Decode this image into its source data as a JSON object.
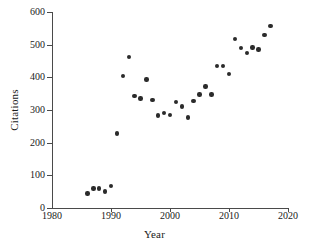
{
  "chart_data": {
    "type": "scatter",
    "title": "",
    "xlabel": "Year",
    "ylabel": "Citations",
    "xlim": [
      1980,
      2020
    ],
    "ylim": [
      0,
      600
    ],
    "xticks": [
      1980,
      1990,
      2000,
      2010,
      2020
    ],
    "yticks": [
      0,
      100,
      200,
      300,
      400,
      500,
      600
    ],
    "grid": false,
    "legend": null,
    "series": [
      {
        "name": "Citations",
        "marker": "filled-circle",
        "color": "#2b2b2b",
        "points": [
          {
            "x": 1986,
            "y": 45
          },
          {
            "x": 1987,
            "y": 60
          },
          {
            "x": 1988,
            "y": 60
          },
          {
            "x": 1989,
            "y": 50
          },
          {
            "x": 1990,
            "y": 68
          },
          {
            "x": 1991,
            "y": 228
          },
          {
            "x": 1992,
            "y": 405
          },
          {
            "x": 1993,
            "y": 462
          },
          {
            "x": 1994,
            "y": 342
          },
          {
            "x": 1995,
            "y": 335
          },
          {
            "x": 1996,
            "y": 393
          },
          {
            "x": 1997,
            "y": 330
          },
          {
            "x": 1998,
            "y": 283
          },
          {
            "x": 1999,
            "y": 290
          },
          {
            "x": 2000,
            "y": 284
          },
          {
            "x": 2001,
            "y": 324
          },
          {
            "x": 2002,
            "y": 311
          },
          {
            "x": 2003,
            "y": 277
          },
          {
            "x": 2004,
            "y": 327
          },
          {
            "x": 2005,
            "y": 347
          },
          {
            "x": 2006,
            "y": 372
          },
          {
            "x": 2007,
            "y": 348
          },
          {
            "x": 2008,
            "y": 435
          },
          {
            "x": 2009,
            "y": 435
          },
          {
            "x": 2010,
            "y": 410
          },
          {
            "x": 2011,
            "y": 518
          },
          {
            "x": 2012,
            "y": 489
          },
          {
            "x": 2013,
            "y": 475
          },
          {
            "x": 2014,
            "y": 491
          },
          {
            "x": 2015,
            "y": 485
          },
          {
            "x": 2016,
            "y": 530
          },
          {
            "x": 2017,
            "y": 557
          }
        ]
      }
    ]
  },
  "axes": {
    "y_label": "Citations",
    "x_label": "Year",
    "y_tick_labels": [
      "0",
      "100",
      "200",
      "300",
      "400",
      "500",
      "600"
    ],
    "x_tick_labels": [
      "1980",
      "1990",
      "2000",
      "2010",
      "2020"
    ]
  },
  "colors": {
    "marker": "#2b2b2b",
    "axis": "#4a4a4a",
    "background": "#ffffff",
    "text": "#1a1a1a"
  }
}
